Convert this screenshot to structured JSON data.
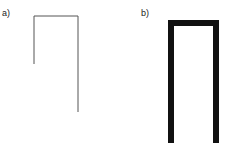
{
  "panels": [
    {
      "label": "a)",
      "style": "thin-line",
      "stroke_color": "#555555",
      "path": [
        [
          34,
          64
        ],
        [
          34,
          16
        ],
        [
          78,
          16
        ],
        [
          78,
          112
        ]
      ]
    },
    {
      "label": "b)",
      "style": "thick-bar",
      "stroke_color": "#111111",
      "path": [
        [
          171,
          143
        ],
        [
          171,
          23
        ],
        [
          216,
          23
        ],
        [
          216,
          143
        ]
      ]
    }
  ]
}
